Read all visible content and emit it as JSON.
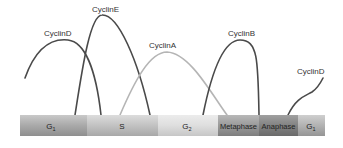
{
  "diagram": {
    "phases": [
      {
        "label": "G",
        "subscript": "1",
        "color_top": "#c9c9c9",
        "color_mid": "#a9a9a9",
        "color_bot": "#8f8f8f"
      },
      {
        "label": "S",
        "subscript": "",
        "color_top": "#dcdcdc",
        "color_mid": "#c2c2c2",
        "color_bot": "#a8a8a8"
      },
      {
        "label": "G",
        "subscript": "2",
        "color_top": "#ececec",
        "color_mid": "#dedede",
        "color_bot": "#c6c6c6"
      },
      {
        "label": "Metaphase",
        "subscript": "",
        "color_top": "#b8b8b8",
        "color_mid": "#9a9a9a",
        "color_bot": "#7e7e7e"
      },
      {
        "label": "Anaphase",
        "subscript": "",
        "color_top": "#a0a0a0",
        "color_mid": "#828282",
        "color_bot": "#6a6a6a"
      },
      {
        "label": "G",
        "subscript": "1",
        "color_top": "#cfcfcf",
        "color_mid": "#b2b2b2",
        "color_bot": "#959595"
      }
    ],
    "curves": [
      {
        "name": "CyclinD",
        "label": "CyclinD",
        "color": "#4a4a4a"
      },
      {
        "name": "CyclinE",
        "label": "CyclinE",
        "color": "#4a4a4a"
      },
      {
        "name": "CyclinA",
        "label": "CyclinA",
        "color": "#b5b5b5"
      },
      {
        "name": "CyclinB",
        "label": "CyclinB",
        "color": "#4a4a4a"
      },
      {
        "name": "CyclinD-next",
        "label": "CyclinD",
        "color": "#4a4a4a"
      }
    ]
  }
}
